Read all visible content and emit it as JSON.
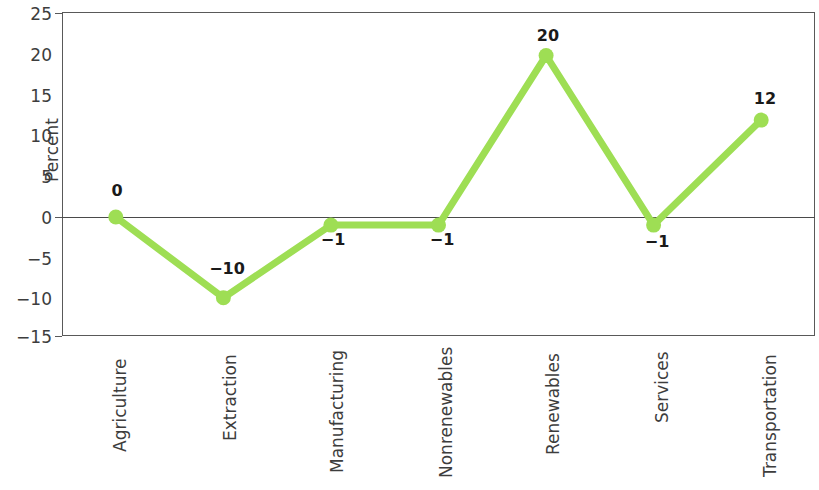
{
  "chart_data": {
    "type": "line",
    "title": "",
    "xlabel": "",
    "ylabel": "Percent",
    "ylim": [
      -15,
      25
    ],
    "yticks": [
      25,
      20,
      15,
      10,
      5,
      0,
      "−5",
      "−10",
      "−15"
    ],
    "ytick_values": [
      25,
      20,
      15,
      10,
      5,
      0,
      -5,
      -10,
      -15
    ],
    "grid": false,
    "legend": false,
    "categories": [
      "Agriculture",
      "Extraction",
      "Manufacturing",
      "Nonrenewables",
      "Renewables",
      "Services",
      "Transportation"
    ],
    "values": [
      0,
      -10,
      -1,
      -1,
      20,
      -1,
      12
    ],
    "point_labels": [
      "0",
      "−10",
      "−1",
      "−1",
      "20",
      "−1",
      "12"
    ],
    "series_color": "#9ede54",
    "marker": "circle",
    "zero_line": true
  },
  "axis": {
    "y_title": "Percent",
    "tick_25": "25",
    "tick_20": "20",
    "tick_15": "15",
    "tick_10": "10",
    "tick_5": "5",
    "tick_0": "0",
    "tick_m5": "−5",
    "tick_m10": "−10",
    "tick_m15": "−15"
  },
  "colors": {
    "series": "#9ede54",
    "frame": "#595959",
    "text": "#3d3d3d",
    "label_text": "#1a1a1a",
    "background": "#ffffff"
  }
}
